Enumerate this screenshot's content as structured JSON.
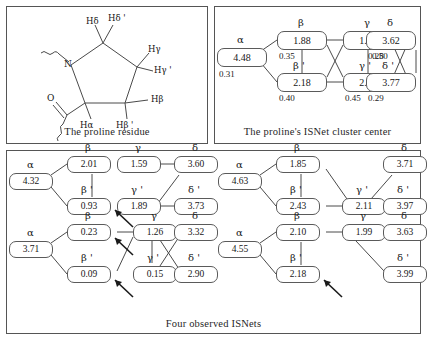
{
  "panels": {
    "residue": {
      "caption": "The proline residue",
      "atoms": [
        {
          "name": "nitrogen",
          "text": "N"
        },
        {
          "name": "oxygen",
          "text": "O"
        }
      ],
      "hydrogen_labels": [
        {
          "name": "h-delta",
          "text": "Hδ"
        },
        {
          "name": "h-delta-prime",
          "text": "Hδ '"
        },
        {
          "name": "h-gamma",
          "text": "Hγ"
        },
        {
          "name": "h-gamma-prime",
          "text": "Hγ '"
        },
        {
          "name": "h-beta",
          "text": "Hβ"
        },
        {
          "name": "h-beta-prime",
          "text": "Hβ '"
        },
        {
          "name": "h-alpha",
          "text": "Hα"
        }
      ]
    },
    "cluster_center": {
      "caption": "The proline's ISNet cluster center",
      "nodes": [
        {
          "name": "alpha",
          "label": "α",
          "value": "4.48",
          "sub": "0.31"
        },
        {
          "name": "beta",
          "label": "β",
          "value": "1.88",
          "sub": "0.35"
        },
        {
          "name": "beta-prime",
          "label": "β '",
          "value": "2.18",
          "sub": "0.40"
        },
        {
          "name": "gamma",
          "label": "γ",
          "value": "1.92",
          "sub": "0.50"
        },
        {
          "name": "gamma-prime",
          "label": "γ '",
          "value": "2.02",
          "sub": "0.45"
        },
        {
          "name": "delta",
          "label": "δ",
          "value": "3.62",
          "sub": "0.28"
        },
        {
          "name": "delta-prime",
          "label": "δ '",
          "value": "3.77",
          "sub": "0.29"
        }
      ]
    },
    "observed": {
      "caption": "Four observed ISNets",
      "nets": [
        {
          "name": "isnet-1",
          "nodes": [
            {
              "name": "alpha",
              "label": "α",
              "value": "4.32"
            },
            {
              "name": "beta",
              "label": "β",
              "value": "2.01"
            },
            {
              "name": "beta-prime",
              "label": "β '",
              "value": "0.93"
            },
            {
              "name": "gamma",
              "label": "γ",
              "value": "1.59"
            },
            {
              "name": "gamma-prime",
              "label": "γ '",
              "value": "1.89"
            },
            {
              "name": "delta",
              "label": "δ",
              "value": "3.60"
            },
            {
              "name": "delta-prime",
              "label": "δ '",
              "value": "3.73"
            }
          ]
        },
        {
          "name": "isnet-2",
          "nodes": [
            {
              "name": "alpha",
              "label": "α",
              "value": "3.71"
            },
            {
              "name": "beta",
              "label": "β",
              "value": "0.23"
            },
            {
              "name": "beta-prime",
              "label": "β '",
              "value": "0.09"
            },
            {
              "name": "gamma",
              "label": "γ",
              "value": "1.26"
            },
            {
              "name": "gamma-prime",
              "label": "γ '",
              "value": "0.15"
            },
            {
              "name": "delta",
              "label": "δ",
              "value": "3.32"
            },
            {
              "name": "delta-prime",
              "label": "δ '",
              "value": "2.90"
            }
          ]
        },
        {
          "name": "isnet-3",
          "nodes": [
            {
              "name": "alpha",
              "label": "α",
              "value": "4.63"
            },
            {
              "name": "beta",
              "label": "β",
              "value": "1.85"
            },
            {
              "name": "beta-prime",
              "label": "β '",
              "value": "2.43"
            },
            {
              "name": "gamma-prime",
              "label": "γ '",
              "value": "2.11"
            },
            {
              "name": "delta",
              "label": "δ",
              "value": "3.71"
            },
            {
              "name": "delta-prime",
              "label": "δ '",
              "value": "3.97"
            }
          ]
        },
        {
          "name": "isnet-4",
          "nodes": [
            {
              "name": "alpha",
              "label": "α",
              "value": "4.55"
            },
            {
              "name": "beta",
              "label": "β",
              "value": "2.10"
            },
            {
              "name": "beta-prime",
              "label": "β '",
              "value": "2.18"
            },
            {
              "name": "gamma",
              "label": "γ",
              "value": "1.99"
            },
            {
              "name": "delta",
              "label": "δ",
              "value": "3.63"
            },
            {
              "name": "delta-prime",
              "label": "δ '",
              "value": "3.99"
            }
          ]
        }
      ]
    }
  },
  "colors": {
    "stroke": "#4a4a4a",
    "border": "#555555",
    "text": "#171717",
    "background": "#ffffff"
  }
}
